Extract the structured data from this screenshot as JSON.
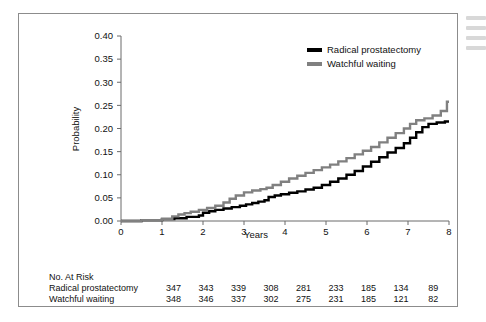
{
  "chart_data": {
    "type": "line",
    "title": "",
    "xlabel": "Years",
    "ylabel": "Probability",
    "xlim": [
      0,
      8
    ],
    "ylim": [
      0,
      0.4
    ],
    "xticks": [
      "0",
      "1",
      "2",
      "3",
      "4",
      "5",
      "6",
      "7",
      "8"
    ],
    "yticks": [
      "0.00",
      "0.05",
      "0.10",
      "0.15",
      "0.20",
      "0.25",
      "0.30",
      "0.35",
      "0.40"
    ],
    "grid": false,
    "legend_position": "top-right",
    "series": [
      {
        "name": "Radical prostatectomy",
        "color": "#000000",
        "x": [
          0,
          0.5,
          1.0,
          1.3,
          1.6,
          1.9,
          2.0,
          2.15,
          2.3,
          2.5,
          2.7,
          2.9,
          3.05,
          3.2,
          3.35,
          3.5,
          3.6,
          3.75,
          3.9,
          4.1,
          4.3,
          4.5,
          4.7,
          4.9,
          5.1,
          5.3,
          5.5,
          5.7,
          5.9,
          6.1,
          6.3,
          6.5,
          6.7,
          6.9,
          7.05,
          7.2,
          7.35,
          7.5,
          7.7,
          7.9,
          8.0
        ],
        "y": [
          0.0,
          0.002,
          0.004,
          0.006,
          0.009,
          0.012,
          0.018,
          0.021,
          0.024,
          0.027,
          0.03,
          0.033,
          0.036,
          0.039,
          0.042,
          0.045,
          0.052,
          0.055,
          0.058,
          0.061,
          0.064,
          0.068,
          0.072,
          0.078,
          0.085,
          0.092,
          0.1,
          0.108,
          0.118,
          0.128,
          0.138,
          0.148,
          0.158,
          0.168,
          0.18,
          0.192,
          0.203,
          0.21,
          0.213,
          0.215,
          0.215
        ]
      },
      {
        "name": "Watchful waiting",
        "color": "#808080",
        "x": [
          0,
          0.5,
          1.0,
          1.25,
          1.4,
          1.55,
          1.7,
          1.9,
          2.1,
          2.3,
          2.5,
          2.65,
          2.8,
          3.0,
          3.2,
          3.4,
          3.55,
          3.7,
          3.9,
          4.1,
          4.3,
          4.5,
          4.7,
          4.9,
          5.1,
          5.3,
          5.5,
          5.7,
          5.9,
          6.1,
          6.3,
          6.5,
          6.7,
          6.9,
          7.05,
          7.2,
          7.4,
          7.6,
          7.8,
          7.95,
          8.0
        ],
        "y": [
          0.0,
          0.002,
          0.005,
          0.01,
          0.014,
          0.017,
          0.02,
          0.024,
          0.028,
          0.033,
          0.04,
          0.048,
          0.055,
          0.062,
          0.066,
          0.069,
          0.072,
          0.078,
          0.085,
          0.092,
          0.098,
          0.104,
          0.11,
          0.116,
          0.122,
          0.129,
          0.136,
          0.144,
          0.152,
          0.16,
          0.17,
          0.18,
          0.19,
          0.2,
          0.21,
          0.218,
          0.222,
          0.228,
          0.238,
          0.258,
          0.258
        ]
      }
    ]
  },
  "legend": {
    "items": [
      {
        "label": "Radical prostatectomy",
        "color": "#000000"
      },
      {
        "label": "Watchful waiting",
        "color": "#808080"
      }
    ]
  },
  "risk_table": {
    "title": "No. At Risk",
    "rows": [
      {
        "name": "Radical prostatectomy",
        "values": [
          "347",
          "343",
          "339",
          "308",
          "281",
          "233",
          "185",
          "134",
          "89"
        ]
      },
      {
        "name": "Watchful waiting",
        "values": [
          "348",
          "346",
          "337",
          "302",
          "275",
          "231",
          "185",
          "121",
          "82"
        ]
      }
    ]
  }
}
